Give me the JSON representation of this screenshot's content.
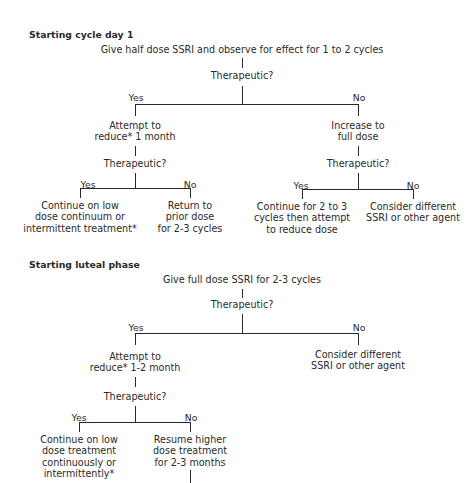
{
  "section1": {
    "heading": "Starting cycle day 1",
    "root": "Give half dose SSRI and observe for effect for 1 to 2 cycles",
    "q1": "Therapeutic?",
    "yes": "Yes",
    "no": "No",
    "left": {
      "action_l1": "Attempt to",
      "action_l2": "reduce* 1 month",
      "q": "Therapeutic?",
      "yes": "Yes",
      "no": "No",
      "yes_out": [
        "Continue on low",
        "dose continuum or",
        "intermittent treatment*"
      ],
      "no_out": [
        "Return to",
        "prior dose",
        "for 2-3 cycles"
      ]
    },
    "right": {
      "action_l1": "Increase to",
      "action_l2": "full dose",
      "q": "Therapeutic?",
      "yes": "Yes",
      "no": "No",
      "yes_out": [
        "Continue for 2 to 3",
        "cycles then attempt",
        "to reduce dose"
      ],
      "no_out": [
        "Consider different",
        "SSRI or other agent"
      ]
    }
  },
  "section2": {
    "heading": "Starting luteal phase",
    "root": "Give full dose SSRI for 2-3 cycles",
    "q1": "Therapeutic?",
    "yes": "Yes",
    "no": "No",
    "left": {
      "action_l1": "Attempt to",
      "action_l2": "reduce* 1-2 month",
      "q": "Therapeutic?",
      "yes": "Yes",
      "no": "No",
      "yes_out": [
        "Continue on low",
        "dose treatment",
        "continuously or",
        "intermittently*"
      ],
      "no_out": [
        "Resume higher",
        "dose treatment",
        "for 2-3 months"
      ]
    },
    "right": {
      "no_out": [
        "Consider different",
        "SSRI or other agent"
      ]
    }
  }
}
